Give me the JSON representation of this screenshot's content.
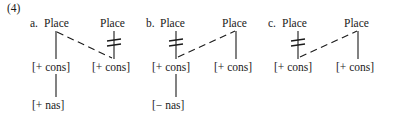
{
  "figure": {
    "example_number": "(4)",
    "background_color": "#ffffff",
    "line_color": "#1a1a1a",
    "items": [
      {
        "letter": "a.",
        "left_tier": {
          "root_label": "Place",
          "feature_label": "[+ cons]",
          "terminal_label": "[+ nas]",
          "association_struck_out": false
        },
        "right_tier": {
          "root_label": "Place",
          "feature_label": "[+ cons]",
          "terminal_label": "",
          "association_struck_out": true
        },
        "spreading_line": {
          "style": "dashed",
          "from": "left-root",
          "to": "right-feature",
          "direction": "down-right"
        }
      },
      {
        "letter": "b.",
        "left_tier": {
          "root_label": "Place",
          "feature_label": "[+ cons]",
          "terminal_label": "[− nas]",
          "association_struck_out": true
        },
        "right_tier": {
          "root_label": "Place",
          "feature_label": "[+ cons]",
          "terminal_label": "",
          "association_struck_out": false
        },
        "spreading_line": {
          "style": "dashed",
          "from": "left-feature",
          "to": "right-root",
          "direction": "up-right"
        }
      },
      {
        "letter": "c.",
        "left_tier": {
          "root_label": "Place",
          "feature_label": "[+ cons]",
          "terminal_label": "",
          "association_struck_out": true
        },
        "right_tier": {
          "root_label": "Place",
          "feature_label": "[+ cons]",
          "terminal_label": "",
          "association_struck_out": false
        },
        "spreading_line": {
          "style": "dashed",
          "from": "left-feature",
          "to": "right-root",
          "direction": "up-right"
        }
      }
    ]
  }
}
